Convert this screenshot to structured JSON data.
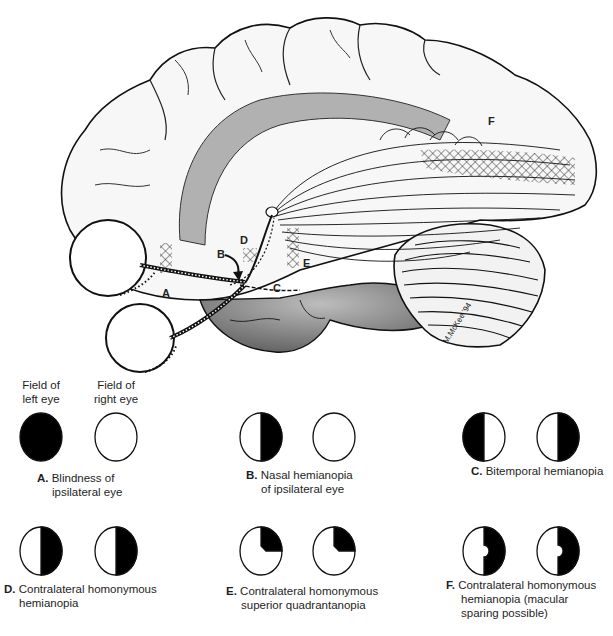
{
  "illustration": {
    "subject": "Lateral view of brain with visual pathway from eyes to occipital cortex",
    "lesion_labels": [
      "A",
      "B",
      "C",
      "D",
      "E",
      "F"
    ],
    "signature": "M.McKee '94"
  },
  "field_headers": {
    "left": "Field of left eye",
    "left_line1": "Field of",
    "left_line2": "left eye",
    "right_line1": "Field of",
    "right_line2": "right eye"
  },
  "panels": [
    {
      "letter": "A.",
      "line1": "Blindness of",
      "line2": "ipsilateral eye",
      "line3": "",
      "left_field": "full-black",
      "right_field": "clear"
    },
    {
      "letter": "B.",
      "line1": "Nasal hemianopia",
      "line2": "of ipsilateral eye",
      "line3": "",
      "left_field": "right-half-black",
      "right_field": "clear"
    },
    {
      "letter": "C.",
      "line1": "Bitemporal hemianopia",
      "line2": "",
      "line3": "",
      "left_field": "left-half-black",
      "right_field": "right-half-black"
    },
    {
      "letter": "D.",
      "line1": "Contralateral homonymous",
      "line2": "hemianopia",
      "line3": "",
      "left_field": "right-half-black",
      "right_field": "right-half-black"
    },
    {
      "letter": "E.",
      "line1": "Contralateral homonymous",
      "line2": "superior quadrantanopia",
      "line3": "",
      "left_field": "upper-right-quadrant-black",
      "right_field": "upper-right-quadrant-black"
    },
    {
      "letter": "F.",
      "line1": "Contralateral homonymous",
      "line2": "hemianopia (macular",
      "line3": "sparing possible)",
      "left_field": "right-half-black-macular-sparing",
      "right_field": "right-half-black-macular-sparing"
    }
  ],
  "colors": {
    "ink": "#111111",
    "paper": "#ffffff",
    "shade": "#8a8a8a",
    "tract": "#9a9a9a"
  }
}
